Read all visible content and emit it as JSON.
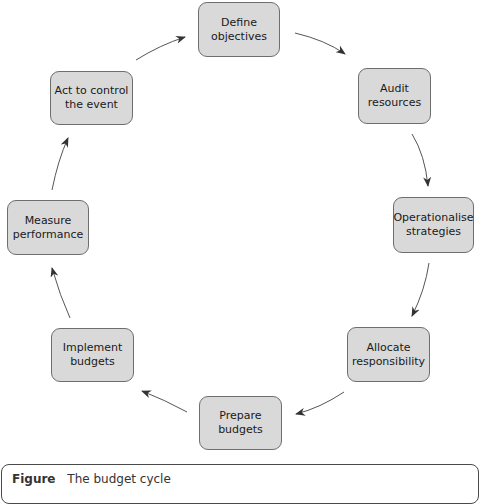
{
  "diagram": {
    "type": "cycle",
    "nodes": [
      {
        "id": "define",
        "label": "Define objectives"
      },
      {
        "id": "audit",
        "label": "Audit resources"
      },
      {
        "id": "operationalise",
        "label": "Operationalise strategies"
      },
      {
        "id": "allocate",
        "label": "Allocate responsibility"
      },
      {
        "id": "prepare",
        "label": "Prepare budgets"
      },
      {
        "id": "implement",
        "label": "Implement budgets"
      },
      {
        "id": "measure",
        "label": "Measure performance"
      },
      {
        "id": "act",
        "label": "Act to control the event"
      }
    ],
    "edges": [
      {
        "from": "define",
        "to": "audit"
      },
      {
        "from": "audit",
        "to": "operationalise"
      },
      {
        "from": "operationalise",
        "to": "allocate"
      },
      {
        "from": "allocate",
        "to": "prepare"
      },
      {
        "from": "prepare",
        "to": "implement"
      },
      {
        "from": "implement",
        "to": "measure"
      },
      {
        "from": "measure",
        "to": "act"
      },
      {
        "from": "act",
        "to": "define"
      }
    ],
    "colors": {
      "node_fill": "#d9d9d9",
      "node_border": "#6e6e6e",
      "arrow": "#333333"
    }
  },
  "caption": {
    "figure": "Figure",
    "text": "The budget cycle"
  }
}
